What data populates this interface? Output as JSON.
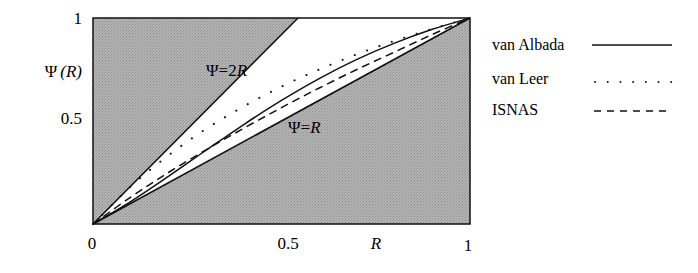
{
  "chart_data": {
    "type": "line",
    "title": "",
    "xlabel": "R",
    "ylabel": "Ψ (R)",
    "xlim": [
      0,
      1
    ],
    "ylim": [
      0,
      1
    ],
    "x_ticks": [
      "0",
      "0.5",
      "1"
    ],
    "y_ticks": [
      "0.5",
      "1"
    ],
    "grid": false,
    "legend_position": "right",
    "shaded_region": "outside the band between Ψ=R and Ψ=2R (TVD region), gray fill",
    "annotations": [
      {
        "text": "Ψ=2R",
        "x": 0.3,
        "y": 0.72
      },
      {
        "text": "Ψ=R",
        "x": 0.55,
        "y": 0.42
      }
    ],
    "series": [
      {
        "name": "van Albada",
        "style": "solid",
        "formula": "(R^2+R)/(1+R^2)",
        "x": [
          0,
          0.1,
          0.2,
          0.3,
          0.4,
          0.5,
          0.6,
          0.7,
          0.8,
          0.9,
          1.0
        ],
        "values": [
          0,
          0.109,
          0.231,
          0.358,
          0.483,
          0.6,
          0.706,
          0.799,
          0.878,
          0.945,
          1.0
        ]
      },
      {
        "name": "van Leer",
        "style": "dotted",
        "formula": "2R/(1+R)",
        "x": [
          0,
          0.1,
          0.2,
          0.3,
          0.4,
          0.5,
          0.6,
          0.7,
          0.8,
          0.9,
          1.0
        ],
        "values": [
          0,
          0.182,
          0.333,
          0.462,
          0.571,
          0.667,
          0.75,
          0.824,
          0.889,
          0.947,
          1.0
        ]
      },
      {
        "name": "ISNAS",
        "style": "dashed",
        "x": [
          0,
          0.1,
          0.2,
          0.3,
          0.4,
          0.5,
          0.6,
          0.7,
          0.8,
          0.9,
          1.0
        ],
        "values": [
          0,
          0.13,
          0.25,
          0.36,
          0.465,
          0.565,
          0.66,
          0.75,
          0.835,
          0.92,
          1.0
        ]
      }
    ]
  },
  "labels": {
    "ylabel_psi": "Ψ",
    "ylabel_arg": "(R)",
    "xlabel": "R",
    "xtick_0": "0",
    "xtick_05": "0.5",
    "xtick_1": "1",
    "ytick_05": "0.5",
    "ytick_1": "1",
    "annot_2r_psi": "Ψ=2",
    "annot_2r_r": "R",
    "annot_r_psi": "Ψ=",
    "annot_r_r": "R"
  },
  "legend": [
    {
      "label": "van Albada",
      "style": "solid"
    },
    {
      "label": "van Leer",
      "style": "dotted"
    },
    {
      "label": "ISNAS",
      "style": "dashed"
    }
  ],
  "colors": {
    "shade": "#a9a9a9",
    "line": "#111111",
    "background": "#ffffff"
  }
}
